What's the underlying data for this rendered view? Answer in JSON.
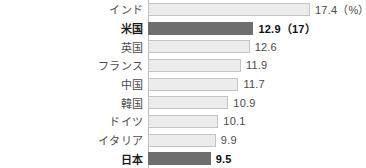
{
  "chart_data": {
    "type": "bar",
    "orientation": "horizontal",
    "title": "",
    "xlabel": "",
    "ylabel": "",
    "unit_note": "(%)",
    "grid": false,
    "legend": null,
    "xlim": [
      4.5,
      17.4
    ],
    "categories": [
      "インド",
      "米国",
      "英国",
      "フランス",
      "中国",
      "韓国",
      "ドイツ",
      "イタリア",
      "日本"
    ],
    "values": [
      17.4,
      12.9,
      12.6,
      11.9,
      11.7,
      10.9,
      10.1,
      9.9,
      9.5
    ],
    "value_labels": [
      "17.4（%）",
      "12.9（17）",
      "12.6",
      "11.9",
      "11.7",
      "10.9",
      "10.1",
      "9.9",
      "9.5"
    ],
    "highlighted": [
      false,
      true,
      false,
      false,
      false,
      false,
      false,
      false,
      true
    ],
    "colors": {
      "bar_light_fill": "#ececec",
      "bar_light_border": "#c4c4c4",
      "bar_dark_fill": "#6e6e6e",
      "text": "#4a4a4a",
      "text_highlight": "#101010",
      "axis": "#b9b9b9",
      "background": "#ffffff"
    }
  }
}
